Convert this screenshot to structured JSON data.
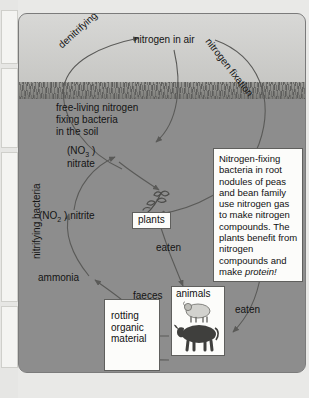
{
  "diagram": {
    "sky_label": "nitrogen in air",
    "curved_labels": {
      "denitrifying": "denitrifying bacteria",
      "fixation": "nitrogen fixation",
      "nitrifying": "nitrifying bacteria"
    },
    "soil_labels": {
      "free_living_line1": "free-living nitrogen",
      "free_living_line2": "fixing bacteria",
      "free_living_line3": "in the soil",
      "nitrate_line1": "(NO3 )",
      "nitrate_line2": "nitrate",
      "nitrite": "(NO2 ) nitrite",
      "ammonia": "ammonia",
      "eaten_left": "eaten",
      "eaten_right": "eaten",
      "faeces_line1": "faeces",
      "faeces_line2": "and",
      "faeces_line3": "urine",
      "death_upper": "death",
      "death_lower": "death"
    },
    "boxes": {
      "plants": "plants",
      "animals": "animals",
      "rotting_line1": "rotting",
      "rotting_line2": "organic",
      "rotting_line3": "material",
      "info_text": "Nitrogen-fixing bacteria in root nodules of peas and bean family use nitrogen gas to make nitrogen compounds. The plants benefit from nitrogen compounds and make ",
      "info_emphasis": "protein!"
    },
    "colors": {
      "sky": "#d0d0ce",
      "grass": "#7d7d79",
      "soil": "#8d8d8d",
      "box_fill": "#fcfcfa",
      "ink": "#141414",
      "arrow": "#5a5a58"
    }
  }
}
